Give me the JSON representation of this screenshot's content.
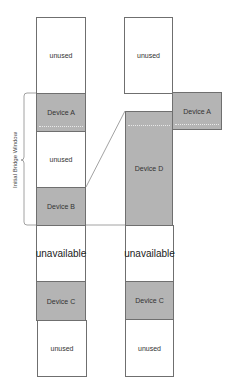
{
  "diagram": {
    "bracket_label": "Initial Bridge Window",
    "left_column": [
      {
        "label": "unused",
        "type": "free"
      },
      {
        "label": "Device A",
        "type": "device"
      },
      {
        "label": "unused",
        "type": "free"
      },
      {
        "label": "Device B",
        "type": "device"
      },
      {
        "label": "unavailable",
        "type": "reserved"
      },
      {
        "label": "Device C",
        "type": "device"
      },
      {
        "label": "unused",
        "type": "free"
      }
    ],
    "right_column": [
      {
        "label": "unused",
        "type": "free"
      },
      {
        "label": "Device A",
        "type": "device",
        "displaced": true
      },
      {
        "label": "Device D",
        "type": "device"
      },
      {
        "label": "unavailable",
        "type": "reserved"
      },
      {
        "label": "Device C",
        "type": "device"
      },
      {
        "label": "unused",
        "type": "free"
      }
    ],
    "colors": {
      "device_fill": "#b4b4b4",
      "border": "#6f6f6f",
      "background": "#ffffff"
    }
  }
}
